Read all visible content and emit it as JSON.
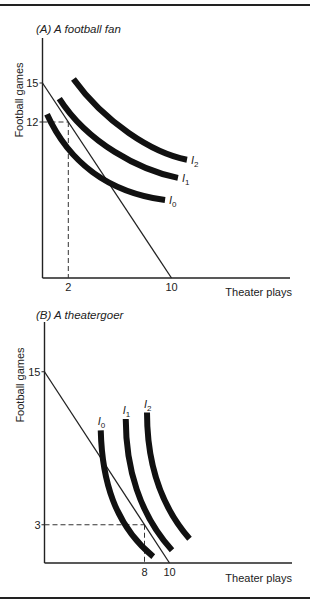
{
  "chart_data": [
    {
      "type": "line",
      "title": "(A) A football fan",
      "xlabel": "Theater plays",
      "ylabel": "Football games",
      "xlim": [
        0,
        20
      ],
      "ylim": [
        0,
        18
      ],
      "x_ticks": [
        2,
        10
      ],
      "y_ticks": [
        12,
        15
      ],
      "budget_line": {
        "x": [
          0,
          10
        ],
        "y": [
          15,
          0
        ]
      },
      "optimum": {
        "x": 2,
        "y": 12
      },
      "grid": false,
      "series": [
        {
          "name": "I0",
          "sub": "0",
          "x": [
            0.35,
            2,
            5,
            9.5
          ],
          "y": [
            12.6,
            9,
            6.6,
            6.0
          ]
        },
        {
          "name": "I1",
          "sub": "1",
          "x": [
            1.3,
            3.5,
            7.5,
            10.5
          ],
          "y": [
            13.8,
            10.4,
            8.3,
            7.7
          ]
        },
        {
          "name": "I2",
          "sub": "2",
          "x": [
            2.4,
            4.8,
            8.5,
            11.2
          ],
          "y": [
            15.3,
            12.0,
            9.6,
            9.1
          ]
        }
      ]
    },
    {
      "type": "line",
      "title": "(B) A theatergoer",
      "xlabel": "Theater plays",
      "ylabel": "Football games",
      "xlim": [
        0,
        20
      ],
      "ylim": [
        0,
        19
      ],
      "x_ticks": [
        8,
        10
      ],
      "y_ticks": [
        3,
        15
      ],
      "budget_line": {
        "x": [
          0,
          10
        ],
        "y": [
          15,
          0
        ]
      },
      "optimum": {
        "x": 8,
        "y": 3
      },
      "grid": false,
      "series": [
        {
          "name": "I0",
          "sub": "0",
          "x": [
            4.5,
            4.6,
            5.6,
            8.7
          ],
          "y": [
            10.4,
            6.5,
            3.0,
            0.5
          ]
        },
        {
          "name": "I1",
          "sub": "1",
          "x": [
            6.5,
            6.5,
            7.6,
            10.2
          ],
          "y": [
            11.3,
            7.5,
            3.8,
            1.0
          ]
        },
        {
          "name": "I2",
          "sub": "2",
          "x": [
            8.2,
            8.2,
            9.2,
            11.6
          ],
          "y": [
            11.8,
            8.0,
            4.6,
            1.9
          ]
        }
      ]
    }
  ]
}
